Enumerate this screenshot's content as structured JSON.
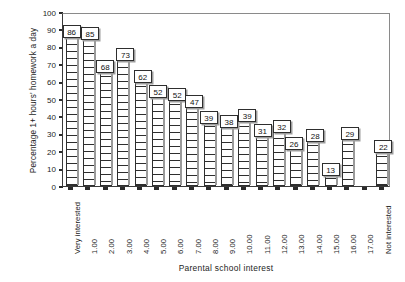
{
  "chart_data": {
    "type": "bar",
    "title": "",
    "xlabel": "Parental school interest",
    "ylabel": "Percentage 1+ hours' homework a day",
    "ylim": [
      0,
      100
    ],
    "ytick_step": 10,
    "grid": false,
    "legend": null,
    "categories": [
      "Very interested",
      "1.00",
      "2.00",
      "3.00",
      "4.00",
      "5.00",
      "6.00",
      "7.00",
      "8.00",
      "9.00",
      "10.00",
      "11.00",
      "12.00",
      "13.00",
      "14.00",
      "15.00",
      "16.00",
      "17.00",
      "Not interested"
    ],
    "values": [
      86,
      85,
      68,
      73,
      62,
      52,
      52,
      47,
      39,
      38,
      39,
      31,
      32,
      26,
      28,
      13,
      29,
      null,
      22
    ],
    "data_labels": [
      "86",
      "85",
      "68",
      "73",
      "62",
      "52",
      "52",
      "47",
      "39",
      "38",
      "39",
      "31",
      "32",
      "26",
      "28",
      "13",
      "29",
      "",
      "22"
    ],
    "ytick_labels": [
      "100",
      "90",
      "80",
      "70",
      "60",
      "50",
      "40",
      "30",
      "20",
      "10",
      "0"
    ],
    "bar_fill": "horizontal-hatch",
    "bar_edge_color": "#2e2e2e",
    "background_color": "#ffffff"
  }
}
